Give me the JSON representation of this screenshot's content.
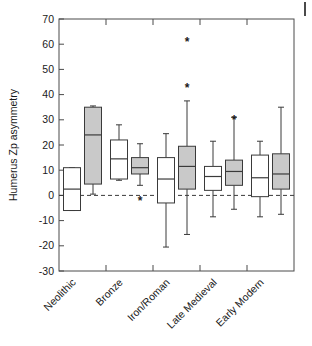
{
  "figure": {
    "page_mark": "page-edge-mark"
  },
  "chart_data": {
    "type": "box",
    "title": "",
    "xlabel": "",
    "ylabel": "Humerus Zp asymmetry",
    "ylim": [
      -30,
      70
    ],
    "yticks": [
      70,
      60,
      50,
      40,
      30,
      20,
      10,
      0,
      -10,
      -20,
      -30
    ],
    "ytick_labels": [
      "70",
      "60",
      "50",
      "40",
      "30",
      "20",
      "10",
      "0",
      "-10",
      "-20",
      "-30"
    ],
    "grid": false,
    "legend": "none",
    "reference_line": 0,
    "categories": [
      "Neolithic",
      "Bronze",
      "Iron/Roman",
      "Late Medieval",
      "Early Modern"
    ],
    "series": [
      {
        "name": "open",
        "fill": "#ffffff",
        "boxes": [
          {
            "category": "Neolithic",
            "whisker_low": -6.0,
            "q1": -6.0,
            "median": 2.5,
            "q3": 11.0,
            "whisker_high": 11.0
          },
          {
            "category": "Bronze",
            "whisker_low": 6.0,
            "q1": 6.5,
            "median": 14.5,
            "q3": 22.0,
            "whisker_high": 28.0
          },
          {
            "category": "Iron/Roman",
            "whisker_low": -20.5,
            "q1": -3.0,
            "median": 6.5,
            "q3": 15.0,
            "whisker_high": 24.5
          },
          {
            "category": "Late Medieval",
            "whisker_low": -8.5,
            "q1": 2.0,
            "median": 7.5,
            "q3": 11.5,
            "whisker_high": 21.5
          },
          {
            "category": "Early Modern",
            "whisker_low": -8.5,
            "q1": -0.5,
            "median": 7.0,
            "q3": 16.0,
            "whisker_high": 21.5
          }
        ]
      },
      {
        "name": "shaded",
        "fill": "#c9c9c9",
        "boxes": [
          {
            "category": "Neolithic",
            "whisker_low": 0.5,
            "q1": 4.5,
            "median": 24.0,
            "q3": 35.0,
            "whisker_high": 35.5
          },
          {
            "category": "Bronze",
            "whisker_low": 4.0,
            "q1": 8.5,
            "median": 11.0,
            "q3": 15.0,
            "whisker_high": 20.5
          },
          {
            "category": "Iron/Roman",
            "whisker_low": -15.5,
            "q1": 2.5,
            "median": 11.5,
            "q3": 19.5,
            "whisker_high": 37.5
          },
          {
            "category": "Late Medieval",
            "whisker_low": -5.5,
            "q1": 4.0,
            "median": 9.5,
            "q3": 14.0,
            "whisker_high": 31.0
          },
          {
            "category": "Early Modern",
            "whisker_low": -7.5,
            "q1": 2.5,
            "median": 8.5,
            "q3": 16.5,
            "whisker_high": 35.0
          }
        ]
      }
    ],
    "outliers": [
      {
        "category": "Bronze",
        "value": -2.0,
        "marker": "*",
        "offset": "shaded"
      },
      {
        "category": "Iron/Roman",
        "value": 43.0,
        "marker": "*",
        "offset": "shaded"
      },
      {
        "category": "Iron/Roman",
        "value": 61.0,
        "marker": "*",
        "offset": "shaded"
      },
      {
        "category": "Late Medieval",
        "value": 30.0,
        "marker": "*",
        "offset": "shaded"
      }
    ]
  }
}
